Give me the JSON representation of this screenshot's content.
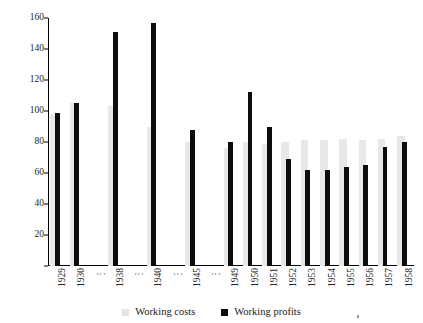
{
  "chart_data": {
    "type": "bar",
    "title": "",
    "xlabel": "",
    "ylabel": "",
    "ylim": [
      0,
      160
    ],
    "ytick_step": 20,
    "yticks": [
      0,
      20,
      40,
      60,
      80,
      100,
      120,
      140,
      160
    ],
    "ytick_labels": [
      "",
      "20",
      "40",
      "60",
      "80",
      "100",
      "120",
      "140",
      "160"
    ],
    "grid": false,
    "legend_position": "bottom-center",
    "categories": [
      "1929",
      "1930",
      "⋮",
      "1938",
      "⋮",
      "1940",
      "⋮",
      "1945",
      "⋮",
      "1949",
      "1950",
      "1951",
      "1952",
      "1953",
      "1954",
      "1955",
      "1956",
      "1957",
      "1958"
    ],
    "gap_categories": [
      "⋮"
    ],
    "series": [
      {
        "name": "Working costs",
        "color": "#e8e8e8",
        "values": [
          98,
          105,
          null,
          103,
          null,
          90,
          null,
          80,
          null,
          76,
          80,
          79,
          80,
          81,
          81,
          82,
          81,
          82,
          84
        ]
      },
      {
        "name": "Working profits",
        "color": "#0d0d0d",
        "values": [
          99,
          105,
          null,
          151,
          null,
          157,
          null,
          88,
          null,
          80,
          112,
          90,
          69,
          62,
          62,
          64,
          65,
          77,
          80
        ]
      }
    ]
  },
  "legend": {
    "items": [
      {
        "label": "Working costs",
        "swatch": "costs"
      },
      {
        "label": "Working profits",
        "swatch": "profits"
      }
    ]
  }
}
